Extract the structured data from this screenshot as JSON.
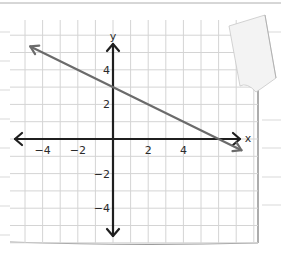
{
  "chart_data": {
    "type": "line",
    "title": "",
    "xlabel": "x",
    "ylabel": "y",
    "xlim": [
      -5.9,
      8.1
    ],
    "ylim": [
      -5.9,
      7
    ],
    "grid": true,
    "grid_step": 1,
    "x_ticks": [
      -4,
      -2,
      2,
      4
    ],
    "y_ticks": [
      4,
      2,
      -2,
      -4
    ],
    "x_tick_labels": [
      "−4",
      "−2",
      "2",
      "4"
    ],
    "y_tick_labels": [
      "4",
      "2",
      "−2",
      "−4"
    ],
    "series": [
      {
        "name": "line",
        "equation": "y = -0.5x + 3",
        "slope": -0.5,
        "y_intercept": 3,
        "x_intercept": 6,
        "x": [
          -4.7,
          7.3
        ],
        "y": [
          5.35,
          -0.65
        ],
        "arrows_both_ends": true,
        "color": "#6b6b6b"
      }
    ],
    "axes": {
      "color": "#1f1f1f",
      "arrows": true
    },
    "grid_color": "#d4d4d4",
    "paper_style": "graph paper with curled top-right corner"
  }
}
